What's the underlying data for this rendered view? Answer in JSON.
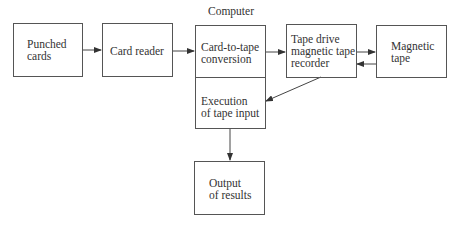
{
  "diagram": {
    "title": "Computer",
    "nodes": {
      "punched_cards": "Punched\ncards",
      "card_reader": "Card reader",
      "card_to_tape": "Card-to-tape\nconversion",
      "execution": "Execution\nof tape input",
      "tape_drive": "Tape drive\nmagnetic tape\nrecorder",
      "magnetic_tape": "Magnetic\ntape",
      "output": "Output\nof results"
    },
    "edges": [
      {
        "from": "Punched cards",
        "to": "Card reader"
      },
      {
        "from": "Card reader",
        "to": "Card-to-tape conversion"
      },
      {
        "from": "Card-to-tape conversion",
        "to": "Tape drive magnetic tape recorder"
      },
      {
        "from": "Tape drive magnetic tape recorder",
        "to": "Magnetic tape"
      },
      {
        "from": "Magnetic tape",
        "to": "Tape drive magnetic tape recorder"
      },
      {
        "from": "Tape drive magnetic tape recorder",
        "to": "Execution of tape input"
      },
      {
        "from": "Execution of tape input",
        "to": "Output of results"
      }
    ]
  }
}
